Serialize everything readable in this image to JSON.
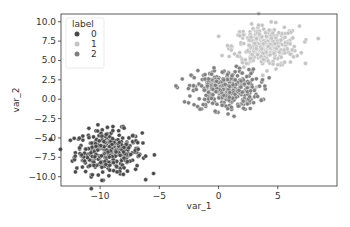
{
  "chart_data": {
    "type": "scatter",
    "title": "",
    "xlabel": "var_1",
    "ylabel": "var_2",
    "xlim": [
      -13.3,
      10.0
    ],
    "ylim": [
      -11.2,
      11.0
    ],
    "xticks": [
      -10,
      -5,
      0,
      5
    ],
    "yticks": [
      10.0,
      7.5,
      5.0,
      2.5,
      0.0,
      -2.5,
      -5.0,
      -7.5,
      -10.0
    ],
    "grid": false,
    "legend": {
      "title": "label",
      "position": "upper left",
      "entries": [
        "0",
        "1",
        "2"
      ]
    },
    "series": [
      {
        "name": "0",
        "color": "#4a4a4a",
        "center": [
          -9.3,
          -6.8
        ],
        "spread": [
          1.4,
          1.4
        ],
        "n": 330
      },
      {
        "name": "1",
        "color": "#c4c4c4",
        "center": [
          4.0,
          6.8
        ],
        "spread": [
          1.4,
          1.3
        ],
        "n": 330
      },
      {
        "name": "2",
        "color": "#808080",
        "center": [
          0.6,
          1.2
        ],
        "spread": [
          1.4,
          1.3
        ],
        "n": 330
      }
    ]
  }
}
